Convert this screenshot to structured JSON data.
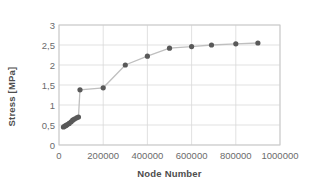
{
  "chart_data": {
    "type": "line",
    "title": "",
    "xlabel": "Node Number",
    "ylabel": "Stress  [MPa]",
    "xlim": [
      0,
      1000000
    ],
    "ylim": [
      0,
      3
    ],
    "grid": true,
    "legend": null,
    "marker": "circle",
    "marker_color": "#595959",
    "line_color": "#bfbfbf",
    "xticks": [
      0,
      200000,
      400000,
      600000,
      800000,
      1000000
    ],
    "xtick_labels": [
      "0",
      "200000",
      "400000",
      "600000",
      "800000",
      "1000000"
    ],
    "yticks": [
      0,
      0.5,
      1,
      1.5,
      2,
      2.5,
      3
    ],
    "ytick_labels": [
      "0",
      "0,5",
      "1",
      "1,5",
      "2",
      "2,5",
      "3"
    ],
    "series": [
      {
        "name": "Stress",
        "x": [
          20000,
          26000,
          32000,
          38000,
          46000,
          55000,
          62000,
          70000,
          80000,
          88000,
          95000,
          200000,
          300000,
          400000,
          500000,
          600000,
          690000,
          800000,
          900000
        ],
        "y": [
          0.45,
          0.47,
          0.49,
          0.51,
          0.54,
          0.58,
          0.62,
          0.65,
          0.68,
          0.7,
          1.38,
          1.43,
          2.0,
          2.22,
          2.42,
          2.46,
          2.5,
          2.53,
          2.55
        ]
      }
    ]
  },
  "axis": {
    "x_title": "Node Number",
    "y_title": "Stress  [MPa]"
  }
}
